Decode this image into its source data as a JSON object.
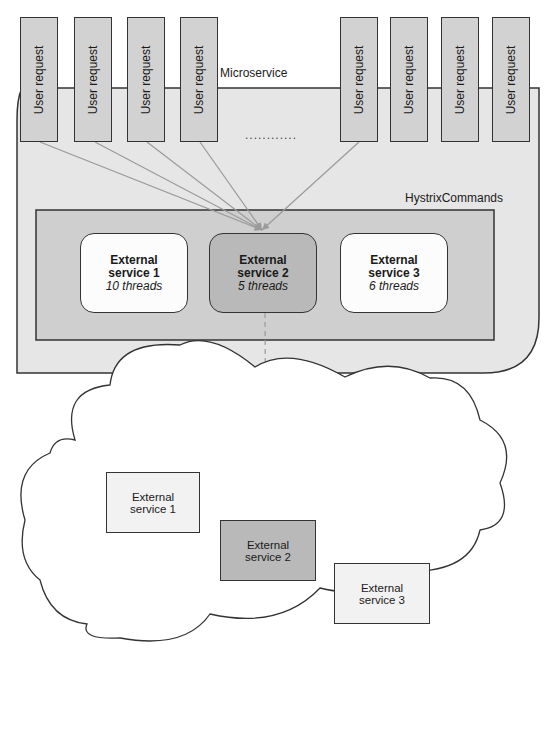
{
  "microservice": {
    "label": "Microservice"
  },
  "user_requests": [
    {
      "label": "User request"
    },
    {
      "label": "User request"
    },
    {
      "label": "User request"
    },
    {
      "label": "User request"
    },
    {
      "label": "User request"
    },
    {
      "label": "User request"
    },
    {
      "label": "User request"
    },
    {
      "label": "User request"
    }
  ],
  "ellipsis": "............",
  "hystrix": {
    "label": "HystrixCommands",
    "services": [
      {
        "name_line1": "External",
        "name_line2": "service 1",
        "threads": "10 threads"
      },
      {
        "name_line1": "External",
        "name_line2": "service 2",
        "threads": "5 threads"
      },
      {
        "name_line1": "External",
        "name_line2": "service 3",
        "threads": "6 threads"
      }
    ]
  },
  "cloud": {
    "services": [
      {
        "line1": "External",
        "line2": "service 1"
      },
      {
        "line1": "External",
        "line2": "service 2"
      },
      {
        "line1": "External",
        "line2": "service 3"
      }
    ]
  },
  "colors": {
    "container_fill": "#e6e6e6",
    "pool_fill": "#cfcfcf",
    "active_fill": "#b9b9b9",
    "arrow": "#9a9a9a"
  }
}
